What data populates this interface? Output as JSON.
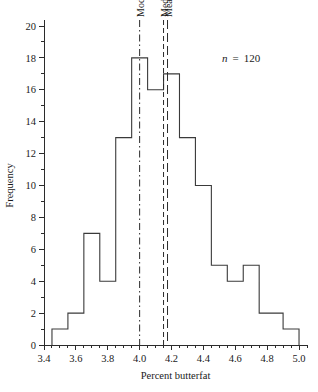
{
  "chart_data": {
    "type": "bar",
    "subtype": "histogram",
    "title": "",
    "xlabel": "Percent butterfat",
    "ylabel": "Frequency",
    "xlim": [
      3.4,
      5.05
    ],
    "ylim": [
      0,
      20
    ],
    "bin_width": 0.05,
    "x_major_ticks": [
      "3.4",
      "3.6",
      "3.8",
      "4.0",
      "4.2",
      "4.4",
      "4.6",
      "4.8",
      "5.0"
    ],
    "x_major_values": [
      3.4,
      3.6,
      3.8,
      4.0,
      4.2,
      4.4,
      4.6,
      4.8,
      5.0
    ],
    "x_minor_step": 0.05,
    "y_major_ticks": [
      "0",
      "2",
      "4",
      "6",
      "8",
      "10",
      "12",
      "14",
      "16",
      "18",
      "20"
    ],
    "y_major_values": [
      0,
      2,
      4,
      6,
      8,
      10,
      12,
      14,
      16,
      18,
      20
    ],
    "y_minor_step": 1,
    "grid": false,
    "legend": "none",
    "bin_starts": [
      3.45,
      3.5,
      3.55,
      3.6,
      3.65,
      3.7,
      3.75,
      3.8,
      3.85,
      3.9,
      3.95,
      4.0,
      4.05,
      4.1,
      4.15,
      4.2,
      4.25,
      4.3,
      4.35,
      4.4,
      4.45,
      4.5,
      4.55,
      4.6,
      4.65,
      4.7,
      4.75,
      4.8,
      4.85,
      4.9,
      4.95
    ],
    "values": [
      1,
      1,
      2,
      7,
      7,
      4,
      4,
      13,
      13,
      18,
      18,
      16,
      17,
      17,
      13,
      13,
      10,
      10,
      5,
      5,
      4,
      5,
      5,
      2,
      2,
      2,
      1
    ],
    "bars": [
      {
        "start": 3.45,
        "end": 3.55,
        "value": 1
      },
      {
        "start": 3.55,
        "end": 3.65,
        "value": 2
      },
      {
        "start": 3.65,
        "end": 3.75,
        "value": 7
      },
      {
        "start": 3.75,
        "end": 3.85,
        "value": 4
      },
      {
        "start": 3.85,
        "end": 3.95,
        "value": 13
      },
      {
        "start": 3.95,
        "end": 4.05,
        "value": 18
      },
      {
        "start": 4.05,
        "end": 4.15,
        "value": 16
      },
      {
        "start": 4.15,
        "end": 4.25,
        "value": 17
      },
      {
        "start": 4.25,
        "end": 4.35,
        "value": 13
      },
      {
        "start": 4.35,
        "end": 4.45,
        "value": 10
      },
      {
        "start": 4.45,
        "end": 4.55,
        "value": 5
      },
      {
        "start": 4.55,
        "end": 4.65,
        "value": 4
      },
      {
        "start": 4.65,
        "end": 4.75,
        "value": 5
      },
      {
        "start": 4.75,
        "end": 4.9,
        "value": 2
      },
      {
        "start": 4.9,
        "end": 5.0,
        "value": 1
      }
    ],
    "annotations": [
      {
        "name": "sample-size",
        "symbol": "n",
        "operator": "=",
        "value": "120",
        "text": "n  =  120"
      }
    ],
    "reference_lines": [
      {
        "name": "mode",
        "label": "Mode",
        "value": 4.0,
        "style": "dash-dot"
      },
      {
        "name": "median",
        "label": "Median",
        "value": 4.15,
        "style": "dashed"
      },
      {
        "name": "mean",
        "label": "Mean",
        "value": 4.175,
        "style": "long-dash"
      }
    ]
  }
}
